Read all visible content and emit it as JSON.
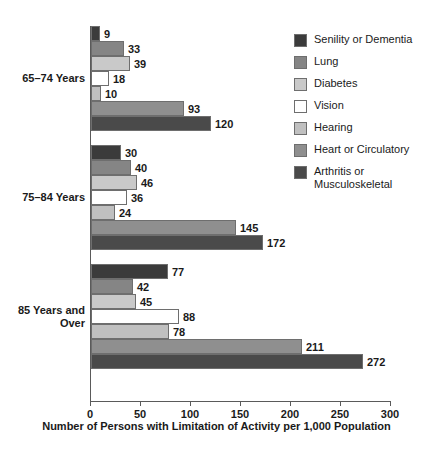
{
  "chart_data": {
    "type": "bar",
    "orientation": "horizontal",
    "title": "",
    "xlabel": "Number of Persons with Limitation of Activity per 1,000 Population",
    "ylabel": "",
    "xlim": [
      0,
      300
    ],
    "xticks": [
      0,
      50,
      100,
      150,
      200,
      250,
      300
    ],
    "grid": false,
    "legend_position": "right",
    "categories": [
      "65–74 Years",
      "75–84 Years",
      "85 Years and Over"
    ],
    "series": [
      {
        "name": "Senility or Dementia",
        "color": "#3b3b3b",
        "values": [
          9,
          30,
          77
        ]
      },
      {
        "name": "Lung",
        "color": "#858585",
        "values": [
          33,
          40,
          42
        ]
      },
      {
        "name": "Diabetes",
        "color": "#c9c9c9",
        "values": [
          39,
          46,
          45
        ]
      },
      {
        "name": "Vision",
        "color": "#ffffff",
        "values": [
          18,
          36,
          88
        ]
      },
      {
        "name": "Hearing",
        "color": "#c0c0c0",
        "values": [
          10,
          24,
          78
        ]
      },
      {
        "name": "Heart or Circulatory",
        "color": "#8f8f8f",
        "values": [
          93,
          145,
          211
        ]
      },
      {
        "name": "Arthritis or Musculoskeletal",
        "color": "#4a4a4a",
        "values": [
          120,
          172,
          272
        ]
      }
    ]
  },
  "legend": {
    "items": [
      {
        "label": "Senility or Dementia"
      },
      {
        "label": "Lung"
      },
      {
        "label": "Diabetes"
      },
      {
        "label": "Vision"
      },
      {
        "label": "Hearing"
      },
      {
        "label": "Heart or Circulatory"
      },
      {
        "label": "Arthritis or Musculoskeletal"
      }
    ]
  },
  "axis": {
    "title": "Number of Persons with Limitation of Activity per 1,000 Population",
    "tick_labels": [
      "0",
      "50",
      "100",
      "150",
      "200",
      "250",
      "300"
    ]
  },
  "groups": [
    {
      "label": "65–74 Years"
    },
    {
      "label": "75–84 Years"
    },
    {
      "label": "85 Years and\nOver"
    }
  ]
}
